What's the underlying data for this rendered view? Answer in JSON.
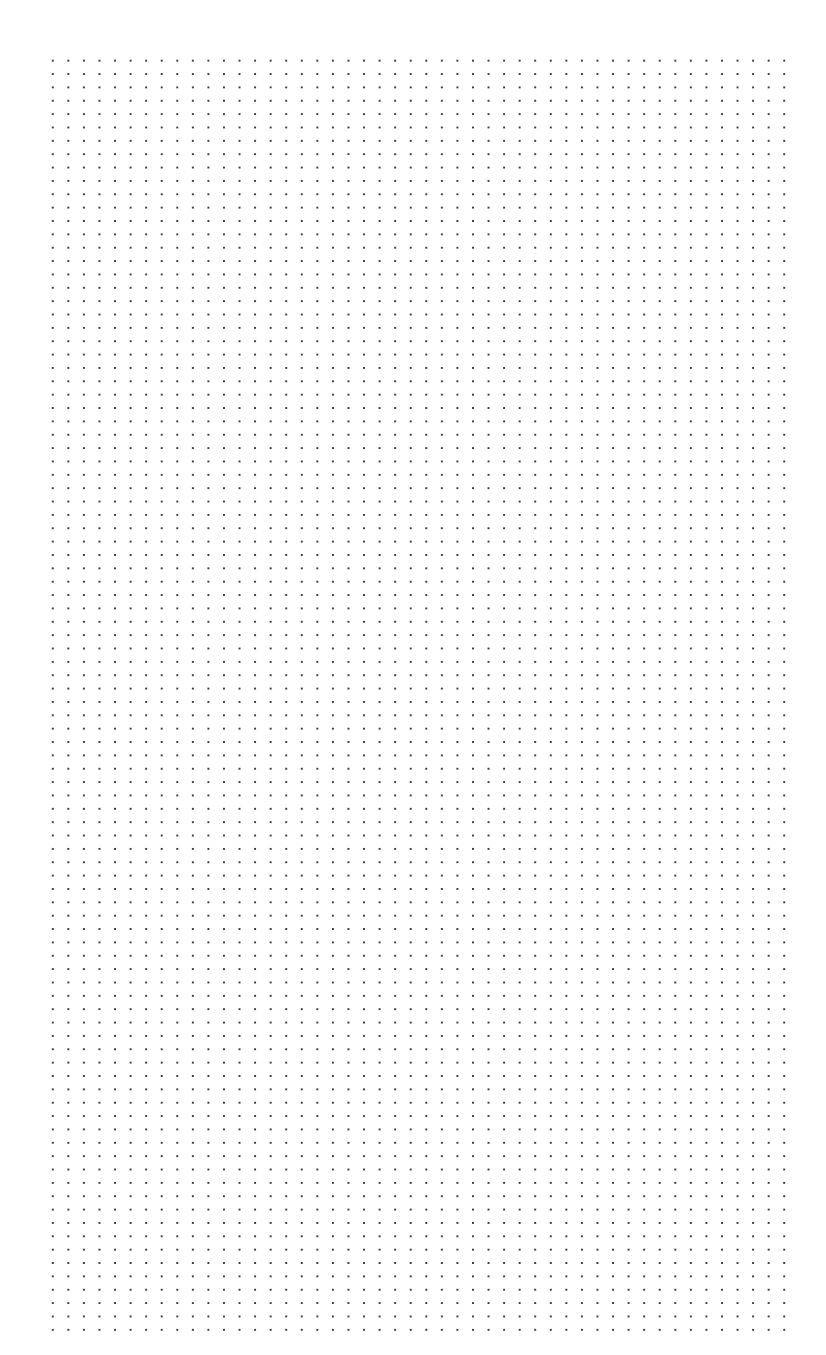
{
  "page": {
    "type": "dot-grid-paper",
    "background_color": "#ffffff",
    "dot_color": "#3a3a3a"
  },
  "grid": {
    "columns": 48,
    "rows": 96,
    "spacing_x_px": 15.57,
    "spacing_y_px": 13.36,
    "first_dot": [
      53,
      61
    ],
    "last_dot": [
      785,
      1328
    ]
  }
}
